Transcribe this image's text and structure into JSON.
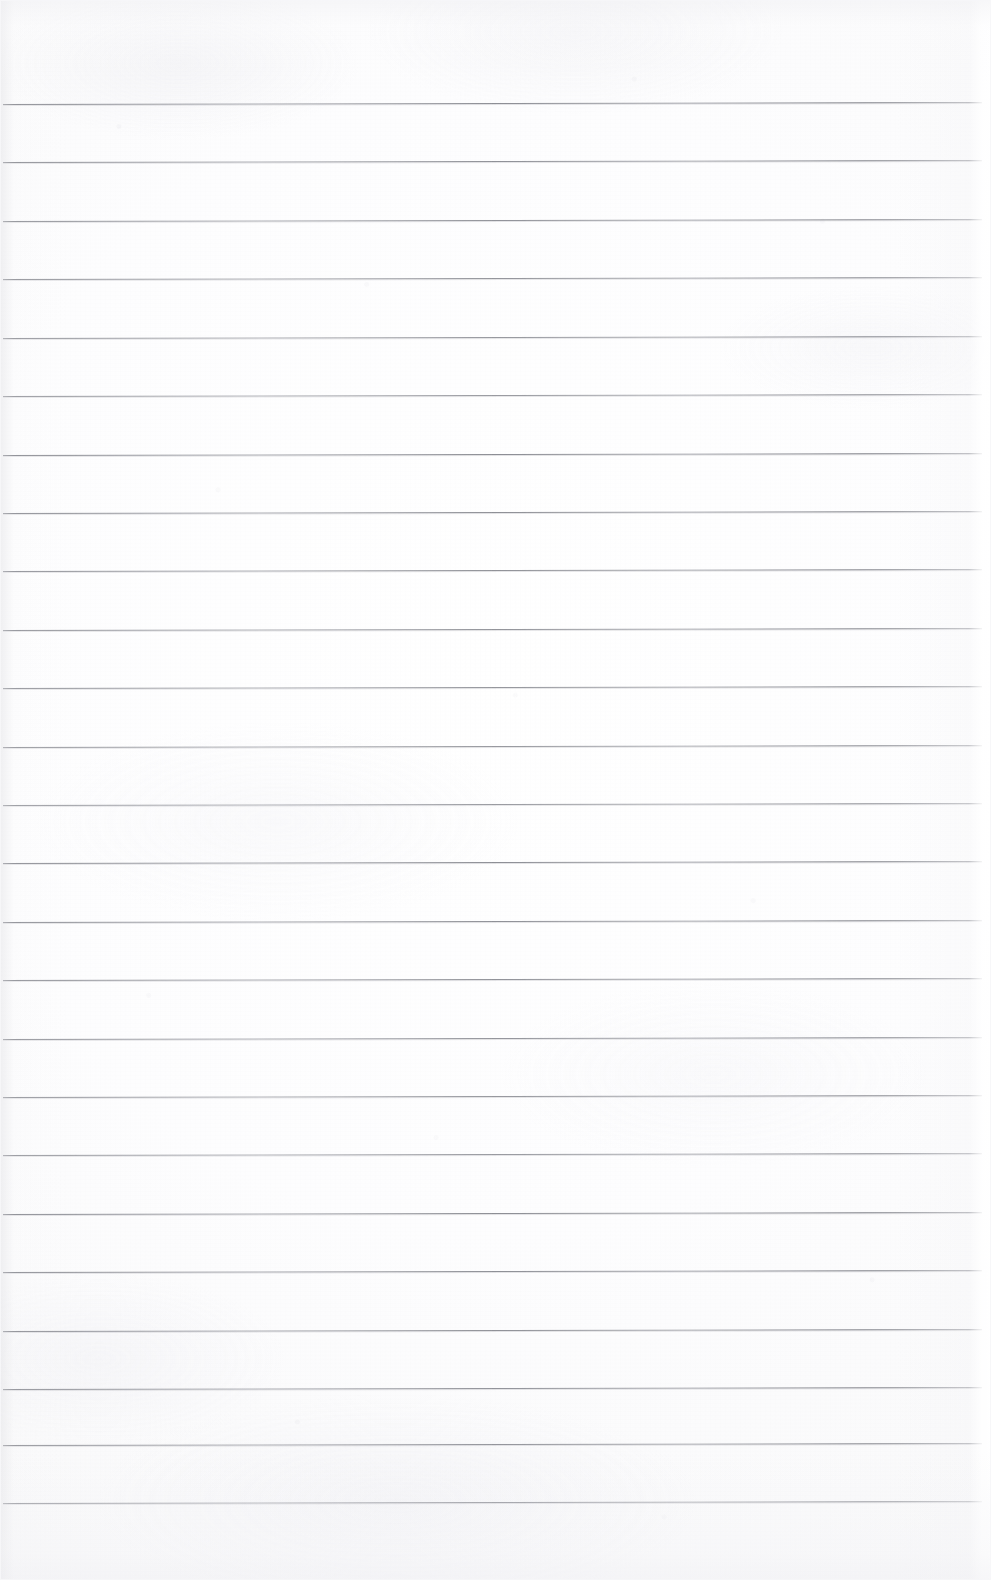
{
  "document": {
    "type": "scanned-image",
    "subject": "blank ruled notebook paper",
    "title": "",
    "visible_text": "",
    "page_width_px": 991,
    "page_height_px": 1580,
    "paper_color": "#fdfdfd",
    "rule_color": "#6c6e76",
    "has_margin_rule": false,
    "has_holes": false,
    "has_handwriting": false
  },
  "ruling": {
    "line_count": 25,
    "first_line_y": 104,
    "line_spacing_px": 58.3,
    "line_left_x": 3,
    "line_right_x": 982,
    "line_thickness_px": 1,
    "slant_deg": -0.12,
    "lines": [
      {
        "index": 1,
        "y": 104,
        "x1": 3,
        "x2": 982
      },
      {
        "index": 2,
        "y": 162,
        "x1": 3,
        "x2": 982
      },
      {
        "index": 3,
        "y": 221,
        "x1": 3,
        "x2": 982
      },
      {
        "index": 4,
        "y": 279,
        "x1": 3,
        "x2": 982
      },
      {
        "index": 5,
        "y": 338,
        "x1": 3,
        "x2": 982
      },
      {
        "index": 6,
        "y": 396,
        "x1": 3,
        "x2": 982
      },
      {
        "index": 7,
        "y": 455,
        "x1": 3,
        "x2": 982
      },
      {
        "index": 8,
        "y": 513,
        "x1": 3,
        "x2": 982
      },
      {
        "index": 9,
        "y": 571,
        "x1": 3,
        "x2": 982
      },
      {
        "index": 10,
        "y": 630,
        "x1": 3,
        "x2": 982
      },
      {
        "index": 11,
        "y": 688,
        "x1": 3,
        "x2": 982
      },
      {
        "index": 12,
        "y": 747,
        "x1": 3,
        "x2": 982
      },
      {
        "index": 13,
        "y": 805,
        "x1": 3,
        "x2": 982
      },
      {
        "index": 14,
        "y": 863,
        "x1": 3,
        "x2": 982
      },
      {
        "index": 15,
        "y": 922,
        "x1": 3,
        "x2": 982
      },
      {
        "index": 16,
        "y": 980,
        "x1": 3,
        "x2": 982
      },
      {
        "index": 17,
        "y": 1039,
        "x1": 3,
        "x2": 982
      },
      {
        "index": 18,
        "y": 1097,
        "x1": 3,
        "x2": 982
      },
      {
        "index": 19,
        "y": 1155,
        "x1": 3,
        "x2": 982
      },
      {
        "index": 20,
        "y": 1214,
        "x1": 3,
        "x2": 982
      },
      {
        "index": 21,
        "y": 1272,
        "x1": 3,
        "x2": 982
      },
      {
        "index": 22,
        "y": 1331,
        "x1": 3,
        "x2": 982
      },
      {
        "index": 23,
        "y": 1389,
        "x1": 3,
        "x2": 982
      },
      {
        "index": 24,
        "y": 1445,
        "x1": 3,
        "x2": 982
      },
      {
        "index": 25,
        "y": 1503,
        "x1": 3,
        "x2": 982
      }
    ]
  },
  "margins": {
    "top_blank_px": 104,
    "bottom_blank_px": 77,
    "left_px": 3,
    "right_px": 9
  }
}
